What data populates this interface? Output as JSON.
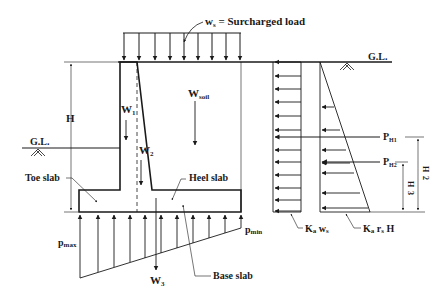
{
  "diagram": {
    "labels": {
      "surcharge": "w",
      "surcharge_sub": "s",
      "surcharge_text": " = Surcharged load",
      "ground_level_left": "G.L.",
      "ground_level_right": "G.L.",
      "height": "H",
      "w1": "W",
      "w1_sub": "1",
      "w2": "W",
      "w2_sub": "2",
      "w3": "W",
      "w3_sub": "3",
      "wsoil": "W",
      "wsoil_sub": "soil",
      "toe_slab": "Toe slab",
      "heel_slab": "Heel slab",
      "base_slab": "Base slab",
      "p_max": "p",
      "p_max_sub": "max",
      "p_min": "p",
      "p_min_sub": "min",
      "ph1": "P",
      "ph1_sub": "H1",
      "ph2": "P",
      "ph2_sub": "H2",
      "h_half_num": "H",
      "h_half_den": "2",
      "h_third_num": "H",
      "h_third_den": "3",
      "ka_ws_k": "K",
      "ka_ws_a": "a",
      "ka_ws_w": " w",
      "ka_ws_s": "s",
      "ka_rs_h_k": "K",
      "ka_rs_h_a": "a",
      "ka_rs_h_r": " r",
      "ka_rs_h_s": "s",
      "ka_rs_h_H": " H"
    },
    "colors": {
      "line": "#1a1a1a",
      "background": "#ffffff"
    }
  }
}
